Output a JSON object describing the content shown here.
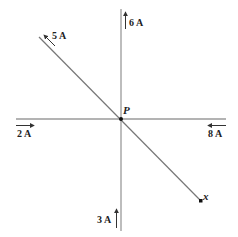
{
  "diagram": {
    "type": "current-carrying wires",
    "point_label": "P",
    "endpoint_label": "x",
    "wires": [
      {
        "id": "vertical",
        "orientation": "vertical"
      },
      {
        "id": "horizontal",
        "orientation": "horizontal"
      },
      {
        "id": "diagonal",
        "orientation": "diagonal"
      }
    ],
    "currents": [
      {
        "label": "5 A",
        "wire": "diagonal",
        "direction": "up-left"
      },
      {
        "label": "6 A",
        "wire": "vertical",
        "direction": "up"
      },
      {
        "label": "2 A",
        "wire": "horizontal",
        "direction": "right"
      },
      {
        "label": "8 A",
        "wire": "horizontal",
        "direction": "left"
      },
      {
        "label": "3 A",
        "wire": "vertical",
        "direction": "up"
      }
    ],
    "colors": {
      "line": "#999999",
      "arrow": "#333333",
      "text": "#222222"
    }
  }
}
